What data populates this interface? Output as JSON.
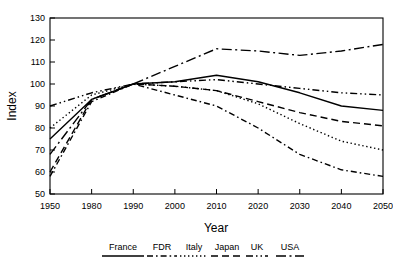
{
  "chart_data": {
    "type": "line",
    "title": "",
    "xlabel": "Year",
    "ylabel": "Index",
    "xlim": [
      1950,
      2050
    ],
    "ylim": [
      50,
      130
    ],
    "yticks": [
      50,
      60,
      70,
      80,
      90,
      100,
      110,
      120,
      130
    ],
    "xticks": [
      1950,
      1980,
      1990,
      2000,
      2010,
      2020,
      2030,
      2040,
      2050
    ],
    "x": [
      1950,
      1980,
      1990,
      2000,
      2010,
      2020,
      2030,
      2040,
      2050
    ],
    "grid": false,
    "legend_position": "bottom",
    "note": "x-axis uses a compressed first interval: 1950 to 1980 occupies the same width as each later 10-year step",
    "series": [
      {
        "name": "France",
        "style": "solid",
        "values": [
          75,
          93,
          100,
          101,
          104,
          101,
          96,
          90,
          88
        ]
      },
      {
        "name": "FDR",
        "style": "dash-dot",
        "values": [
          58,
          92,
          100,
          95,
          90,
          80,
          68,
          61,
          58
        ]
      },
      {
        "name": "Italy",
        "style": "dotted",
        "values": [
          80,
          95,
          100,
          99,
          97,
          91,
          82,
          74,
          70
        ]
      },
      {
        "name": "Japan",
        "style": "dashed",
        "values": [
          60,
          93,
          100,
          99,
          97,
          92,
          87,
          83,
          81
        ]
      },
      {
        "name": "UK",
        "style": "dash-dot-dot",
        "values": [
          90,
          96,
          100,
          101,
          102,
          100,
          98,
          96,
          95
        ]
      },
      {
        "name": "USA",
        "style": "long-dash-dot",
        "values": [
          68,
          93,
          100,
          108,
          116,
          115,
          113,
          115,
          118
        ]
      }
    ]
  },
  "axes": {
    "ylabel": "Index",
    "xlabel": "Year",
    "ytick_labels": [
      "130",
      "120",
      "110",
      "100",
      "90",
      "80",
      "70",
      "60",
      "50"
    ],
    "xtick_labels": [
      "1950",
      "1980",
      "1990",
      "2000",
      "2010",
      "2020",
      "2030",
      "2040",
      "2050"
    ]
  },
  "legend": {
    "entries": [
      {
        "label": "France",
        "style": "solid"
      },
      {
        "label": "FDR",
        "style": "dash-dot"
      },
      {
        "label": "Italy",
        "style": "dotted"
      },
      {
        "label": "Japan",
        "style": "dashed"
      },
      {
        "label": "UK",
        "style": "dash-dot-dot"
      },
      {
        "label": "USA",
        "style": "long-dash-dot"
      }
    ]
  },
  "colors": {
    "line": "#000000",
    "frame": "#000000",
    "background": "#ffffff"
  }
}
